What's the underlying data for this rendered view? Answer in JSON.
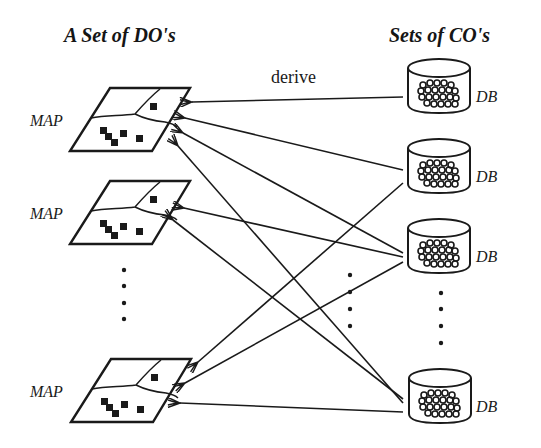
{
  "headings": {
    "left": "A Set of DO's",
    "right": "Sets of CO's"
  },
  "edge_label": "derive",
  "maps": [
    {
      "label": "MAP",
      "x": 70,
      "y": 88
    },
    {
      "label": "MAP",
      "x": 70,
      "y": 181
    },
    {
      "label": "MAP",
      "x": 70,
      "y": 359
    }
  ],
  "databases": [
    {
      "label": "DB",
      "x": 408,
      "y": 58
    },
    {
      "label": "DB",
      "x": 408,
      "y": 138
    },
    {
      "label": "DB",
      "x": 408,
      "y": 218
    },
    {
      "label": "DB",
      "x": 408,
      "y": 368
    }
  ],
  "arrows": [
    {
      "from": "DB 1",
      "to": "MAP 1",
      "x1": 403,
      "y1": 97,
      "x2": 192,
      "y2": 102
    },
    {
      "from": "DB 2",
      "to": "MAP 1",
      "x1": 403,
      "y1": 170,
      "x2": 185,
      "y2": 118
    },
    {
      "from": "DB 3",
      "to": "MAP 1",
      "x1": 403,
      "y1": 253,
      "x2": 183,
      "y2": 133
    },
    {
      "from": "DB 4",
      "to": "MAP 1",
      "x1": 403,
      "y1": 403,
      "x2": 178,
      "y2": 146
    },
    {
      "from": "DB 3",
      "to": "MAP 2",
      "x1": 403,
      "y1": 257,
      "x2": 184,
      "y2": 208
    },
    {
      "from": "DB 4",
      "to": "MAP 2",
      "x1": 403,
      "y1": 399,
      "x2": 173,
      "y2": 220
    },
    {
      "from": "DB 2",
      "to": "MAP 3",
      "x1": 403,
      "y1": 183,
      "x2": 198,
      "y2": 362
    },
    {
      "from": "DB 3",
      "to": "MAP 3",
      "x1": 403,
      "y1": 262,
      "x2": 185,
      "y2": 383
    },
    {
      "from": "DB 4",
      "to": "MAP 3",
      "x1": 403,
      "y1": 412,
      "x2": 180,
      "y2": 403
    }
  ],
  "ellipses": [
    {
      "name": "maps-ellipsis",
      "x": 124,
      "ys": [
        270,
        286,
        303,
        319
      ]
    },
    {
      "name": "middle-ellipsis",
      "x": 350,
      "ys": [
        275,
        292,
        309,
        326
      ]
    },
    {
      "name": "db-ellipsis",
      "x": 441,
      "ys": [
        293,
        309,
        326,
        343
      ]
    }
  ],
  "colors": {
    "ink": "#1a1a1a",
    "background": "#ffffff"
  }
}
